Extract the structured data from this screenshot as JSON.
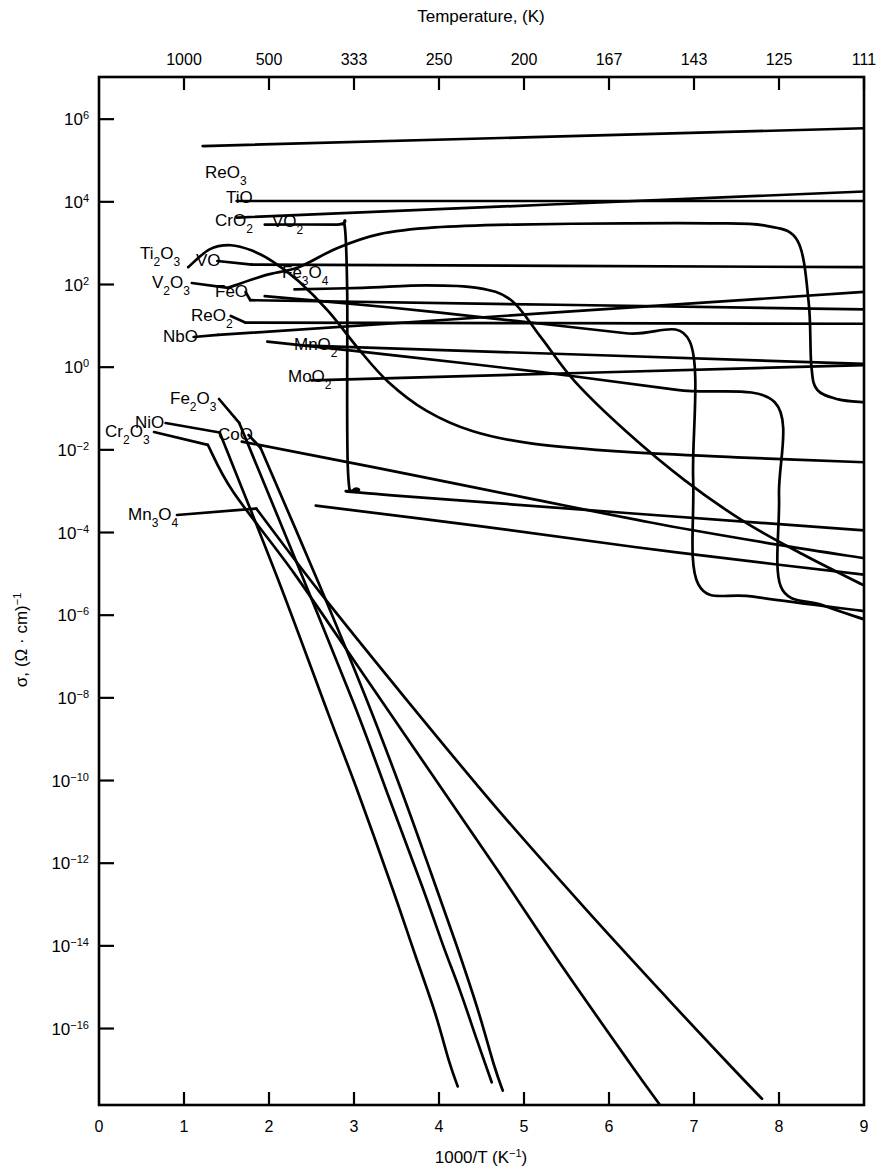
{
  "figure": {
    "top_axis_title": "Temperature, (K)",
    "bottom_axis_title": "1000/T (K",
    "bottom_axis_title_sup": "−1",
    "bottom_axis_title_tail": ")",
    "y_axis_label_sigma": "σ,",
    "y_axis_label_units": "(Ω · cm)",
    "y_axis_label_units_sup": "−1"
  },
  "chart_data": {
    "type": "line",
    "xlabel": "1000/T (K⁻¹)",
    "ylabel": "σ, (Ω·cm)⁻¹",
    "xlim": [
      0,
      9
    ],
    "ylim_log10": [
      -17.8,
      7.0
    ],
    "grid": false,
    "legend": "inline-labels",
    "x_ticks": [
      "0",
      "1",
      "2",
      "3",
      "4",
      "5",
      "6",
      "7",
      "8",
      "9"
    ],
    "x_tick_values": [
      0,
      1,
      2,
      3,
      4,
      5,
      6,
      7,
      8,
      9
    ],
    "y_ticks": [
      "6",
      "4",
      "2",
      "0",
      "-2",
      "-4",
      "-6",
      "-8",
      "-10",
      "-12",
      "-14",
      "-16"
    ],
    "y_tick_exponents": [
      6,
      4,
      2,
      0,
      -2,
      -4,
      -6,
      -8,
      -10,
      -12,
      -14,
      -16
    ],
    "top_axis_ticks": [
      "1000",
      "500",
      "333",
      "250",
      "200",
      "167",
      "143",
      "125",
      "111"
    ],
    "top_axis_tick_x": [
      1,
      2,
      3,
      4,
      5,
      6,
      7,
      8,
      9
    ],
    "series": [
      {
        "name": "ReO3",
        "label": "ReO₃",
        "label_x": 205,
        "label_y": 178,
        "points": [
          [
            1.22,
            5.35
          ],
          [
            9.0,
            5.78
          ]
        ]
      },
      {
        "name": "TiO",
        "label": "TiO",
        "label_x": 226,
        "label_y": 203,
        "points": [
          [
            1.62,
            4.02
          ],
          [
            9.0,
            4.02
          ]
        ]
      },
      {
        "name": "CrO2",
        "label": "CrO₂",
        "label_x": 215,
        "label_y": 226,
        "points": [
          [
            1.62,
            3.62
          ],
          [
            9.0,
            4.25
          ]
        ]
      },
      {
        "name": "VO2",
        "label": "VO₂",
        "label_x": 272,
        "label_y": 227,
        "points": [
          [
            1.95,
            3.45
          ],
          [
            2.8,
            3.45
          ],
          [
            2.89,
            3.42
          ],
          [
            2.92,
            1.8
          ],
          [
            2.93,
            -2.55
          ],
          [
            3.05,
            -2.95
          ],
          [
            3.45,
            -3.1
          ],
          [
            9.0,
            -3.95
          ]
        ]
      },
      {
        "name": "Ti2O3",
        "label": "Ti₂O₃",
        "label_x": 140,
        "label_y": 259,
        "points": [
          [
            1.05,
            2.42
          ],
          [
            1.3,
            2.85
          ],
          [
            1.55,
            2.95
          ],
          [
            1.8,
            2.82
          ],
          [
            2.05,
            2.55
          ],
          [
            2.35,
            2.08
          ],
          [
            2.7,
            1.35
          ],
          [
            3.05,
            0.45
          ],
          [
            3.4,
            -0.35
          ],
          [
            3.85,
            -1.05
          ],
          [
            4.4,
            -1.55
          ],
          [
            5.1,
            -1.85
          ],
          [
            6.2,
            -2.05
          ],
          [
            7.5,
            -2.18
          ],
          [
            9.0,
            -2.3
          ]
        ]
      },
      {
        "name": "VO",
        "label": "VO",
        "label_x": 196,
        "label_y": 266,
        "points": [
          [
            1.8,
            2.48
          ],
          [
            9.0,
            2.42
          ]
        ]
      },
      {
        "name": "V2O3",
        "label": "V₂O₃",
        "label_x": 152,
        "label_y": 288,
        "points": [
          [
            1.52,
            1.92
          ],
          [
            1.95,
            2.22
          ],
          [
            2.35,
            2.42
          ],
          [
            2.8,
            2.88
          ],
          [
            3.3,
            3.22
          ],
          [
            3.95,
            3.38
          ],
          [
            4.9,
            3.45
          ],
          [
            6.2,
            3.48
          ],
          [
            7.2,
            3.48
          ],
          [
            7.85,
            3.42
          ],
          [
            8.22,
            3.05
          ],
          [
            8.35,
            1.55
          ],
          [
            8.38,
            0.05
          ],
          [
            8.45,
            -0.55
          ],
          [
            8.7,
            -0.78
          ],
          [
            9.0,
            -0.85
          ]
        ]
      },
      {
        "name": "Fe3O4",
        "label": "Fe₃O₄",
        "label_x": 282,
        "label_y": 278,
        "points": [
          [
            2.3,
            1.88
          ],
          [
            3.1,
            1.92
          ],
          [
            3.85,
            1.98
          ],
          [
            4.45,
            1.92
          ],
          [
            4.85,
            1.62
          ],
          [
            5.2,
            0.72
          ],
          [
            5.6,
            -0.35
          ],
          [
            6.2,
            -1.55
          ],
          [
            6.9,
            -2.75
          ],
          [
            7.6,
            -3.75
          ],
          [
            8.3,
            -4.55
          ],
          [
            9.0,
            -5.28
          ]
        ]
      },
      {
        "name": "FeO",
        "label": "FeO",
        "label_x": 215,
        "label_y": 297,
        "points": [
          [
            1.78,
            1.62
          ],
          [
            9.0,
            1.4
          ]
        ]
      },
      {
        "name": "ReO2",
        "label": "ReO₂",
        "label_x": 191,
        "label_y": 321,
        "points": [
          [
            1.72,
            1.08
          ],
          [
            9.0,
            1.05
          ]
        ]
      },
      {
        "name": "NbO",
        "label": "NbO",
        "label_x": 163,
        "label_y": 342,
        "points": [
          [
            1.4,
            0.78
          ],
          [
            9.0,
            1.82
          ]
        ]
      },
      {
        "name": "MnO2",
        "label": "MnO₂",
        "label_x": 294,
        "label_y": 350,
        "points": [
          [
            2.45,
            0.52
          ],
          [
            9.0,
            0.08
          ]
        ]
      },
      {
        "name": "MoO2",
        "label": "MoO₂",
        "label_x": 288,
        "label_y": 382,
        "points": [
          [
            2.5,
            -0.32
          ],
          [
            9.0,
            0.05
          ]
        ]
      },
      {
        "name": "Fe2O3",
        "label": "Fe₂O₃",
        "label_x": 170,
        "label_y": 404,
        "points": [
          [
            1.65,
            -1.35
          ],
          [
            2.3,
            -4.6
          ],
          [
            3.0,
            -8.15
          ],
          [
            3.4,
            -10.35
          ],
          [
            3.8,
            -12.55
          ],
          [
            4.05,
            -14.0
          ],
          [
            4.25,
            -15.1
          ],
          [
            4.45,
            -16.3
          ],
          [
            4.62,
            -17.3
          ]
        ]
      },
      {
        "name": "NiO",
        "label": "NiO",
        "label_x": 135,
        "label_y": 428,
        "points": [
          [
            1.42,
            -1.58
          ],
          [
            2.1,
            -5.1
          ],
          [
            2.7,
            -8.4
          ],
          [
            3.05,
            -10.3
          ],
          [
            3.45,
            -12.6
          ],
          [
            3.7,
            -14.1
          ],
          [
            3.95,
            -15.6
          ],
          [
            4.12,
            -16.8
          ],
          [
            4.22,
            -17.4
          ]
        ]
      },
      {
        "name": "Cr2O3",
        "label": "Cr₂O₃",
        "label_x": 105,
        "label_y": 437,
        "points": [
          [
            1.28,
            -1.88
          ],
          [
            1.58,
            -3.02
          ],
          [
            2.3,
            -5.0
          ],
          [
            3.1,
            -7.4
          ],
          [
            3.9,
            -9.8
          ],
          [
            4.7,
            -12.2
          ],
          [
            5.45,
            -14.5
          ],
          [
            6.25,
            -16.85
          ],
          [
            6.6,
            -17.85
          ]
        ]
      },
      {
        "name": "CoO",
        "label": "CoO",
        "label_x": 218,
        "label_y": 440,
        "points": [
          [
            1.9,
            -1.95
          ],
          [
            2.6,
            -5.3
          ],
          [
            3.15,
            -8.05
          ],
          [
            3.55,
            -10.2
          ],
          [
            3.9,
            -12.2
          ],
          [
            4.2,
            -13.95
          ],
          [
            4.45,
            -15.5
          ],
          [
            4.65,
            -16.9
          ],
          [
            4.75,
            -17.5
          ]
        ]
      },
      {
        "name": "Mn3O4",
        "label": "Mn₃O₄",
        "label_x": 128,
        "label_y": 520,
        "points": [
          [
            1.85,
            -3.42
          ],
          [
            2.6,
            -5.45
          ],
          [
            3.6,
            -8.0
          ],
          [
            4.65,
            -10.6
          ],
          [
            5.7,
            -13.05
          ],
          [
            6.7,
            -15.3
          ],
          [
            7.45,
            -16.95
          ],
          [
            7.8,
            -17.7
          ]
        ]
      },
      {
        "name": "transition-A",
        "label": "",
        "label_x": 0,
        "label_y": 0,
        "points": [
          [
            1.95,
            1.72
          ],
          [
            3.4,
            1.45
          ],
          [
            4.9,
            1.12
          ],
          [
            6.2,
            0.82
          ],
          [
            6.95,
            0.62
          ],
          [
            6.99,
            -2.7
          ],
          [
            7.05,
            -5.25
          ],
          [
            7.7,
            -5.55
          ],
          [
            9.0,
            -5.9
          ]
        ]
      },
      {
        "name": "transition-B",
        "label": "",
        "label_x": 0,
        "label_y": 0,
        "points": [
          [
            1.98,
            0.62
          ],
          [
            3.5,
            0.28
          ],
          [
            5.2,
            -0.12
          ],
          [
            6.8,
            -0.55
          ],
          [
            7.95,
            -0.85
          ],
          [
            8.0,
            -3.1
          ],
          [
            8.02,
            -5.3
          ],
          [
            8.5,
            -5.75
          ],
          [
            9.0,
            -6.1
          ]
        ]
      },
      {
        "name": "long-descend",
        "label": "",
        "label_x": 0,
        "label_y": 0,
        "points": [
          [
            1.68,
            -1.8
          ],
          [
            3.3,
            -2.45
          ],
          [
            5.0,
            -3.15
          ],
          [
            6.6,
            -3.8
          ],
          [
            8.0,
            -4.3
          ],
          [
            9.0,
            -4.62
          ]
        ]
      },
      {
        "name": "mid-descend",
        "label": "",
        "label_x": 0,
        "label_y": 0,
        "points": [
          [
            2.55,
            -3.35
          ],
          [
            4.5,
            -3.85
          ],
          [
            6.3,
            -4.35
          ],
          [
            8.0,
            -4.78
          ],
          [
            9.0,
            -5.02
          ]
        ]
      }
    ]
  }
}
